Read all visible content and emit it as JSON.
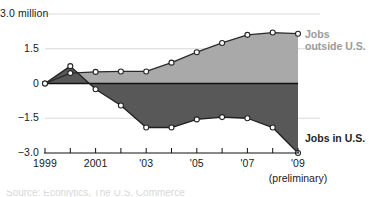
{
  "chart_data": {
    "type": "area",
    "title": "",
    "subtitle": "",
    "xlabel": "",
    "ylabel": "",
    "unit_label": "million",
    "x": [
      1999,
      2000,
      2001,
      2002,
      2003,
      2004,
      2005,
      2006,
      2007,
      2008,
      2009
    ],
    "xtick_labels": [
      "1999",
      "",
      "2001",
      "",
      "'03",
      "",
      "'05",
      "",
      "'07",
      "",
      "'09"
    ],
    "xtick_values": [
      1999,
      2000,
      2001,
      2002,
      2003,
      2004,
      2005,
      2006,
      2007,
      2008,
      2009
    ],
    "xlim": [
      1999,
      2009
    ],
    "ylim": [
      -3.0,
      3.0
    ],
    "ytick_labels": [
      "3.0 million",
      "1.5",
      "0",
      "-1.5",
      "-3.0"
    ],
    "ytick_values": [
      3.0,
      1.5,
      0,
      -1.5,
      -3.0
    ],
    "grid": true,
    "legend_position": "right-inline",
    "zero_line": true,
    "series": [
      {
        "name": "Jobs outside U.S.",
        "color": "#a9a9a9",
        "line_color": "#2a2a2a",
        "marker": "open-circle",
        "values": [
          0.0,
          0.45,
          0.5,
          0.52,
          0.52,
          0.9,
          1.35,
          1.75,
          2.1,
          2.2,
          2.15
        ]
      },
      {
        "name": "Jobs in U.S.",
        "color": "#585858",
        "line_color": "#1f1f1f",
        "marker": "open-circle",
        "values": [
          0.0,
          0.75,
          -0.25,
          -0.95,
          -1.9,
          -1.9,
          -1.55,
          -1.45,
          -1.5,
          -1.9,
          -3.0
        ]
      }
    ],
    "annotations": [
      {
        "name": "preliminary-note",
        "text": "(preliminary)",
        "x": 2009
      }
    ]
  },
  "labels": {
    "y_top": "3.0 million",
    "y_mid_upper": "1.5",
    "y_zero": "0",
    "y_mid_lower": "−1.5",
    "y_bottom": "−3.0",
    "x_1999": "1999",
    "x_2001": "2001",
    "x_03": "'03",
    "x_05": "'05",
    "x_07": "'07",
    "x_09": "'09",
    "preliminary": "(preliminary)",
    "series_outside_line1": "Jobs",
    "series_outside_line2": "outside U.S.",
    "series_inside": "Jobs in U.S.",
    "footer_cut": "Source: Econlytics, The U.S. Commerce"
  },
  "colors": {
    "area_outside": "#a9a9a9",
    "area_inside": "#585858",
    "line": "#242424",
    "grid": "#d9d9d9",
    "zero_line": "#111111",
    "axis": "#111111",
    "marker_fill": "#ffffff",
    "text": "#1a1a1a",
    "label_outside": "#9a9a9a"
  }
}
